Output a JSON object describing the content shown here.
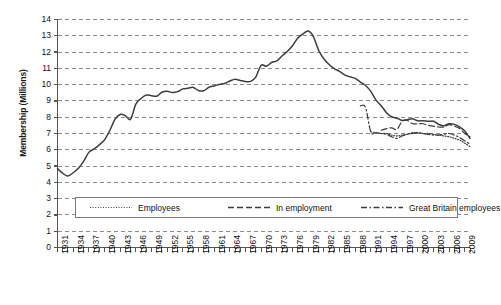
{
  "chart_data": {
    "type": "line",
    "title": "",
    "xlabel": "",
    "ylabel": "Membership (Millions)",
    "ylim": [
      0,
      14
    ],
    "xlim": [
      1931,
      2010
    ],
    "y_ticks": [
      0,
      1,
      2,
      3,
      4,
      5,
      6,
      7,
      8,
      9,
      10,
      11,
      12,
      13,
      14
    ],
    "x_tick_labels": [
      "1931",
      "1934",
      "1937",
      "1940",
      "1943",
      "1946",
      "1949",
      "1952",
      "1955",
      "1958",
      "1961",
      "1964",
      "1967",
      "1970",
      "1973",
      "1976",
      "1979",
      "1982",
      "1985",
      "1988",
      "1991",
      "1994",
      "1997",
      "2000",
      "2003",
      "2006",
      "2009"
    ],
    "x_tick_step": 3,
    "x_minor_tick_step": 1,
    "grid": "horizontal-dashed",
    "legend_position": "inside-lower-center",
    "series": [
      {
        "name": "Employees",
        "style": "dotted",
        "x": [
          1991,
          1992,
          1993,
          1994,
          1995,
          1996,
          1997,
          1998,
          1999,
          2000,
          2001,
          2002,
          2003,
          2004,
          2005,
          2006,
          2007,
          2008,
          2009,
          2010
        ],
        "values": [
          7.1,
          7.05,
          7.0,
          7.0,
          6.9,
          6.85,
          6.9,
          6.95,
          7.05,
          7.05,
          7.0,
          7.0,
          6.95,
          6.9,
          6.85,
          6.8,
          6.7,
          6.6,
          6.4,
          6.2
        ]
      },
      {
        "name": "In employment",
        "style": "dashed",
        "x": [
          1993,
          1994,
          1995,
          1996,
          1997,
          1998,
          1999,
          2000,
          2001,
          2002,
          2003,
          2004,
          2005,
          2006,
          2007,
          2008,
          2009,
          2010
        ],
        "values": [
          7.2,
          7.3,
          7.35,
          7.25,
          7.75,
          7.8,
          7.6,
          7.6,
          7.6,
          7.5,
          7.45,
          7.4,
          7.4,
          7.55,
          7.45,
          7.3,
          7.0,
          6.8
        ]
      },
      {
        "name": "Great Britain employees",
        "style": "dash-dot",
        "x": [
          1989,
          1990,
          1991,
          1992,
          1993,
          1994,
          1995,
          1996,
          1997,
          1998,
          1999,
          2000,
          2001,
          2002,
          2003,
          2004,
          2005,
          2006,
          2007,
          2008,
          2009,
          2010
        ],
        "values": [
          8.7,
          8.6,
          7.1,
          7.05,
          7.0,
          6.95,
          6.8,
          6.7,
          6.85,
          6.95,
          7.0,
          7.05,
          7.0,
          6.95,
          6.9,
          6.9,
          6.95,
          7.0,
          6.9,
          6.75,
          6.55,
          6.35
        ]
      },
      {
        "name": "Total union membership",
        "style": "solid",
        "x": [
          1931,
          1932,
          1933,
          1934,
          1935,
          1936,
          1937,
          1938,
          1939,
          1940,
          1941,
          1942,
          1943,
          1944,
          1945,
          1946,
          1947,
          1948,
          1949,
          1950,
          1951,
          1952,
          1953,
          1954,
          1955,
          1956,
          1957,
          1958,
          1959,
          1960,
          1961,
          1962,
          1963,
          1964,
          1965,
          1966,
          1967,
          1968,
          1969,
          1970,
          1971,
          1972,
          1973,
          1974,
          1975,
          1976,
          1977,
          1978,
          1979,
          1980,
          1981,
          1982,
          1983,
          1984,
          1985,
          1986,
          1987,
          1988,
          1989,
          1990,
          1991,
          1992,
          1993,
          1994,
          1995,
          1996,
          1997,
          1998,
          1999,
          2000,
          2001,
          2002,
          2003,
          2004,
          2005,
          2006,
          2007,
          2008,
          2009,
          2010
        ],
        "values": [
          4.84,
          4.56,
          4.39,
          4.59,
          4.87,
          5.29,
          5.84,
          6.05,
          6.3,
          6.61,
          7.17,
          7.87,
          8.17,
          8.09,
          7.88,
          8.8,
          9.15,
          9.36,
          9.32,
          9.29,
          9.53,
          9.59,
          9.52,
          9.57,
          9.74,
          9.78,
          9.83,
          9.64,
          9.62,
          9.84,
          9.92,
          10.01,
          10.07,
          10.22,
          10.33,
          10.26,
          10.19,
          10.2,
          10.48,
          11.19,
          11.13,
          11.36,
          11.46,
          11.76,
          12.03,
          12.39,
          12.85,
          13.11,
          13.29,
          12.95,
          12.11,
          11.59,
          11.24,
          10.99,
          10.82,
          10.6,
          10.48,
          10.38,
          10.16,
          9.95,
          9.59,
          9.05,
          8.7,
          8.28,
          8.03,
          7.94,
          7.8,
          7.85,
          7.9,
          7.78,
          7.78,
          7.75,
          7.75,
          7.56,
          7.47,
          7.6,
          7.56,
          7.4,
          7.15,
          6.7
        ]
      }
    ]
  },
  "legend": {
    "items": [
      {
        "label": "Employees",
        "style": "dotted"
      },
      {
        "label": "In employment",
        "style": "dashed"
      },
      {
        "label": "Great Britain employees",
        "style": "dash-dot"
      }
    ]
  },
  "axis": {
    "y_title": "Membership (Millions)"
  },
  "colors": {
    "line": "#3d3d3d",
    "grid": "#8c8c8c",
    "axis": "#555555",
    "legend_border": "#7b7b7b",
    "text": "#111111",
    "background": "#ffffff"
  }
}
